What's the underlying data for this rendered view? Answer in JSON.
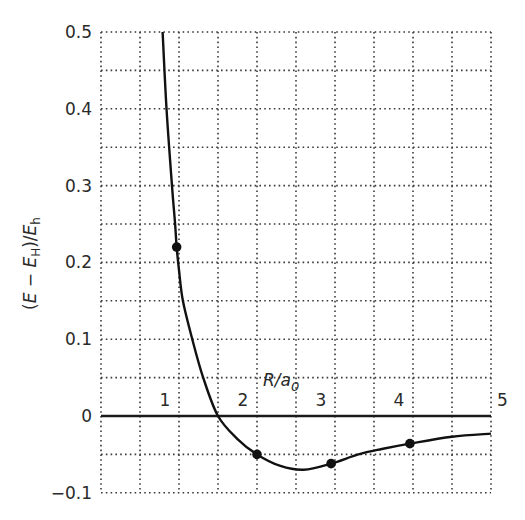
{
  "chart_data": {
    "type": "line",
    "title": "",
    "xlabel": "R/a0",
    "ylabel": "(E − E_H)/E_h",
    "xlim": [
      0,
      5
    ],
    "ylim": [
      -0.1,
      0.5
    ],
    "grid": true,
    "grid_style": "dotted",
    "x_grid_step": 0.5,
    "y_grid_step": 0.05,
    "x_ticks": [
      1,
      2,
      3,
      4,
      5
    ],
    "x_tick_labels": [
      "1",
      "2",
      "3",
      "4",
      "5"
    ],
    "y_ticks": [
      -0.1,
      0,
      0.1,
      0.2,
      0.3,
      0.4,
      0.5
    ],
    "y_tick_labels": [
      "−0.1",
      "0",
      "0.1",
      "0.2",
      "0.3",
      "0.4",
      "0.5"
    ],
    "legend": null,
    "series": [
      {
        "name": "potential energy curve",
        "style": "solid line",
        "x": [
          0.79,
          0.84,
          0.91,
          0.95,
          0.97,
          1.0,
          1.05,
          1.17,
          1.31,
          1.5,
          1.75,
          2.0,
          2.3,
          2.6,
          2.95,
          3.3,
          3.6,
          3.96,
          4.5,
          5.0
        ],
        "y": [
          0.5,
          0.4,
          0.3,
          0.25,
          0.22,
          0.19,
          0.15,
          0.1,
          0.05,
          0.0,
          -0.03,
          -0.05,
          -0.065,
          -0.07,
          -0.062,
          -0.05,
          -0.043,
          -0.036,
          -0.027,
          -0.023
        ]
      },
      {
        "name": "data points",
        "style": "filled circle markers",
        "x": [
          0.97,
          2.0,
          2.95,
          3.96
        ],
        "y": [
          0.22,
          -0.05,
          -0.062,
          -0.036
        ]
      }
    ],
    "annotations": {
      "minimum": {
        "x": 2.6,
        "y": -0.07
      },
      "zero_crossing_x": 1.5
    }
  },
  "labels": {
    "x_axis_title_main": "R/a",
    "x_axis_title_sub": "0",
    "y_axis_title": "(E − E_H)/E_h"
  }
}
